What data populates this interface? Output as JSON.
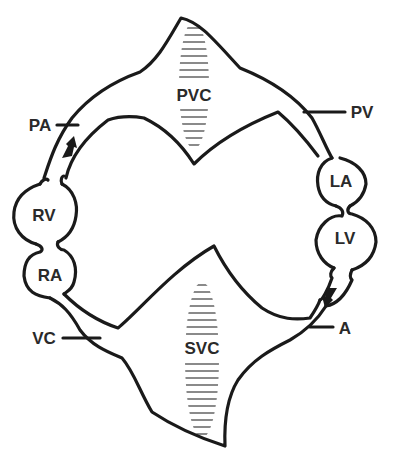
{
  "diagram": {
    "colors": {
      "line": "#1a1a1a",
      "hatch": "#8a8a8a",
      "label": "#2a2a2a",
      "background": "#ffffff"
    },
    "compartments": {
      "pvc": {
        "label": "PVC",
        "x": 194,
        "y": 95
      },
      "svc": {
        "label": "SVC",
        "x": 202,
        "y": 348
      },
      "rv": {
        "label": "RV",
        "x": 38,
        "y": 215
      },
      "ra": {
        "label": "RA",
        "x": 40,
        "y": 275
      },
      "la": {
        "label": "LA",
        "x": 341,
        "y": 181
      },
      "lv": {
        "label": "LV",
        "x": 345,
        "y": 238
      }
    },
    "vessels": {
      "pa": {
        "label": "PA",
        "x": 40,
        "y": 125
      },
      "pv": {
        "label": "PV",
        "x": 362,
        "y": 112
      },
      "vc": {
        "label": "VC",
        "x": 44,
        "y": 338
      },
      "a": {
        "label": "A",
        "x": 345,
        "y": 328
      }
    },
    "arrows": [
      {
        "name": "pulmonary-flow-arrow",
        "direction": "up-right"
      },
      {
        "name": "systemic-flow-arrow",
        "direction": "down-left"
      }
    ]
  }
}
